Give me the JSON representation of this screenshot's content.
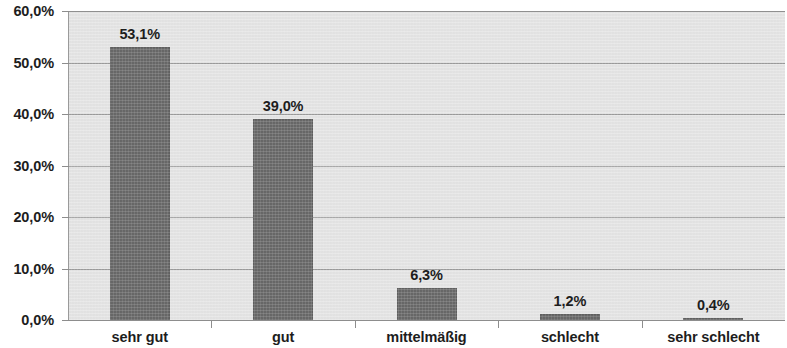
{
  "chart_data": {
    "type": "bar",
    "title": "",
    "subtitle": "",
    "xlabel": "",
    "ylabel": "",
    "categories": [
      "sehr gut",
      "gut",
      "mittelmäßig",
      "schlecht",
      "sehr schlecht"
    ],
    "values": [
      53.1,
      39.0,
      6.3,
      1.2,
      0.4
    ],
    "data_labels": [
      "53,1%",
      "39,0%",
      "6,3%",
      "1,2%",
      "0,4%"
    ],
    "ylim": [
      0,
      60
    ],
    "ytick_values": [
      0,
      10,
      20,
      30,
      40,
      50,
      60
    ],
    "ytick_labels": [
      "0,0%",
      "10,0%",
      "20,0%",
      "30,0%",
      "40,0%",
      "50,0%",
      "60,0%"
    ],
    "grid": true,
    "grid_axis": "y",
    "legend": false,
    "legend_position": "none",
    "annotations": [],
    "colors": {
      "bar_fill": "#676767",
      "plot_background": "#e7e7e7",
      "gridline": "#9c9c9c",
      "axis_line": "#8d8d8d",
      "text": "#1d1d1d",
      "figure_background": "#ffffff"
    }
  }
}
